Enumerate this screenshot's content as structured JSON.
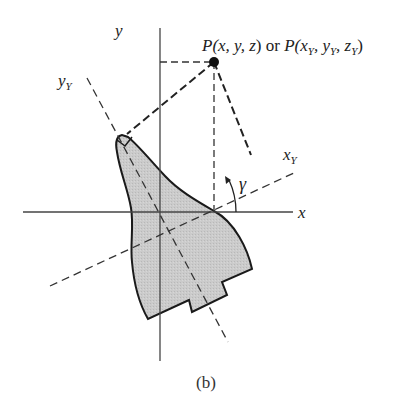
{
  "figure": {
    "caption": "(b)",
    "labels": {
      "x_axis": "x",
      "y_axis": "y",
      "x_rot_main": "x",
      "x_rot_sub": "Y",
      "y_rot_main": "y",
      "y_rot_sub": "Y",
      "angle": "γ",
      "point": {
        "p1": "P(",
        "p2": "x, y, z",
        "p3": ") or ",
        "p4": "P(",
        "p5": "x",
        "p5s": "Y",
        "p6": ", y",
        "p6s": "Y",
        "p7": ", z",
        "p7s": "Y",
        "p8": ")"
      }
    },
    "colors": {
      "shape_fill": "#c8c8c8",
      "line": "#222222",
      "axis": "#444444"
    }
  }
}
